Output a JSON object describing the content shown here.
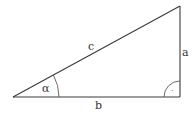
{
  "diagram": {
    "type": "right-triangle",
    "vertices": {
      "A": {
        "x": 13,
        "y": 97
      },
      "C": {
        "x": 180,
        "y": 97
      },
      "B": {
        "x": 180,
        "y": 6
      }
    },
    "labels": {
      "hypotenuse": "c",
      "vertical_leg": "a",
      "horizontal_leg": "b",
      "angle": "α",
      "right_angle_marker": "·"
    },
    "colors": {
      "line": "#3a3a3a",
      "text": "#333333",
      "background": "#ffffff"
    }
  }
}
